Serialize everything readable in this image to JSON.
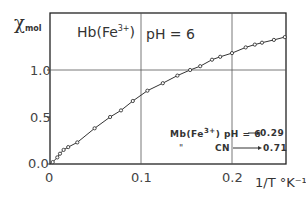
{
  "chart_data": {
    "type": "line",
    "title_parts": {
      "protein": "Hb(Fe",
      "superscript": "3+",
      "close": ")",
      "condition": "pH = 6"
    },
    "xlabel": "1/T °K⁻¹",
    "ylabel": "χ mol",
    "ylabel_symbol": "χ",
    "ylabel_sub": "mol",
    "xlim": [
      0,
      0.26
    ],
    "ylim": [
      0,
      1.6
    ],
    "x_ticks": [
      0,
      0.1,
      0.2
    ],
    "x_tick_labels": [
      "0",
      "0.1",
      "0.2"
    ],
    "y_ticks": [
      0.0,
      0.5,
      1.0
    ],
    "y_tick_labels": [
      "0.0",
      "0.5",
      "1.0"
    ],
    "grid": {
      "vertical": [
        0.1,
        0.2
      ],
      "horizontal": [
        1.0
      ]
    },
    "series": [
      {
        "name": "Hb(Fe3+) pH 6",
        "marker": "open-circle",
        "line": "solid",
        "x": [
          0.003,
          0.008,
          0.011,
          0.015,
          0.02,
          0.03,
          0.049,
          0.066,
          0.078,
          0.091,
          0.107,
          0.124,
          0.14,
          0.154,
          0.165,
          0.178,
          0.187,
          0.2,
          0.215,
          0.225,
          0.233,
          0.246,
          0.258
        ],
        "values": [
          0.02,
          0.07,
          0.11,
          0.15,
          0.18,
          0.23,
          0.38,
          0.5,
          0.57,
          0.67,
          0.78,
          0.86,
          0.94,
          1.0,
          1.04,
          1.11,
          1.14,
          1.18,
          1.24,
          1.27,
          1.29,
          1.32,
          1.35
        ]
      }
    ],
    "annotations": [
      {
        "text_left": "Mb(Fe",
        "sup": "3+",
        "text_mid": ") pH = 6",
        "arrow": "→",
        "value": "0.29"
      },
      {
        "text_left": "\"",
        "text_mid": "CN",
        "arrow": "→",
        "value": "0.71"
      }
    ]
  }
}
